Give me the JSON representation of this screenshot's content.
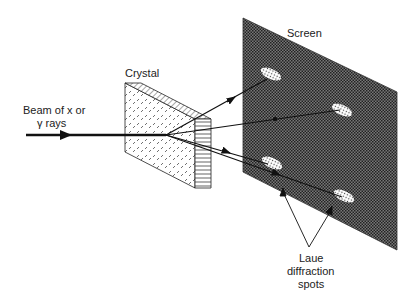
{
  "diagram": {
    "labels": {
      "beam_line1": "Beam of x or",
      "beam_line2": "γ rays",
      "crystal": "Crystal",
      "screen": "Screen",
      "spots_line1": "Laue",
      "spots_line2": "diffraction",
      "spots_line3": "spots"
    },
    "colors": {
      "screen_fill": "#4a4a4a",
      "line": "#111111",
      "background": "#ffffff"
    }
  }
}
